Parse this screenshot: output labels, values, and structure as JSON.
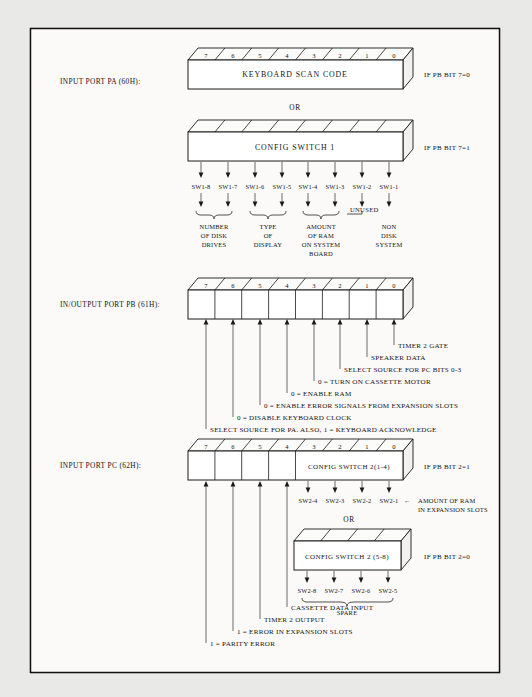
{
  "ports": [
    {
      "id": "pa",
      "label": "INPUT PORT PA (60H):",
      "boxes": [
        {
          "id": "pa-scan",
          "caption": "KEYBOARD SCAN CODE",
          "bits": [
            "7",
            "6",
            "5",
            "4",
            "3",
            "2",
            "1",
            "0"
          ],
          "condition": "IF PB BIT 7=0"
        },
        {
          "id": "pa-config",
          "caption": "CONFIG  SWITCH 1",
          "bits": [
            "",
            "",
            "",
            "",
            "",
            "",
            "",
            ""
          ],
          "condition": "IF PB BIT 7=1"
        }
      ],
      "or_label": "OR",
      "switch_labels": [
        "SW1-8",
        "SW1-7",
        "SW1-6",
        "SW1-5",
        "SW1-4",
        "SW1-3",
        "SW1-2",
        "SW1-1"
      ],
      "groups": [
        {
          "id": "num-disk-drives",
          "lines": [
            "NUMBER",
            "OF DISK",
            "DRIVES"
          ]
        },
        {
          "id": "type-of-display",
          "lines": [
            "TYPE",
            "OF",
            "DISPLAY"
          ]
        },
        {
          "id": "amount-of-ram",
          "lines": [
            "AMOUNT",
            "OF RAM",
            "ON SYSTEM",
            "BOARD"
          ]
        },
        {
          "id": "non-disk-system",
          "lines": [
            "NON",
            "DISK",
            "SYSTEM"
          ]
        }
      ],
      "unused_label": "UNUSED"
    },
    {
      "id": "pb",
      "label": "IN/OUTPUT PORT PB (61H):",
      "boxes": [
        {
          "id": "pb-main",
          "caption": "",
          "bits": [
            "7",
            "6",
            "5",
            "4",
            "3",
            "2",
            "1",
            "0"
          ],
          "condition": ""
        }
      ],
      "callouts": [
        {
          "bit": "0",
          "text": "TIMER 2 GATE"
        },
        {
          "bit": "1",
          "text": "SPEAKER DATA"
        },
        {
          "bit": "2",
          "text": "SELECT SOURCE FOR PC BITS 0-3"
        },
        {
          "bit": "3",
          "text": "0 = TURN ON CASSETTE MOTOR"
        },
        {
          "bit": "4",
          "text": "0 = ENABLE RAM"
        },
        {
          "bit": "5",
          "text": "0 = ENABLE ERROR SIGNALS FROM EXPANSION SLOTS"
        },
        {
          "bit": "6",
          "text": "0 = DISABLE KEYBOARD CLOCK"
        },
        {
          "bit": "7",
          "text": "SELECT SOURCE FOR PA. ALSO, 1 = KEYBOARD ACKNOWLEDGE"
        }
      ]
    },
    {
      "id": "pc",
      "label": "INPUT PORT PC (62H):",
      "boxes": [
        {
          "id": "pc-main",
          "caption": "CONFIG SWITCH 2(1-4)",
          "bits": [
            "7",
            "6",
            "5",
            "4",
            "3",
            "2",
            "1",
            "0"
          ],
          "condition": "IF PB BIT 2=1"
        },
        {
          "id": "pc-alt",
          "caption": "CONFIG SWITCH 2 (5-8)",
          "bits": [
            "",
            "",
            "",
            ""
          ],
          "condition": "IF PB BIT 2=0"
        }
      ],
      "or_label": "OR",
      "switch_labels_upper": [
        "SW2-4",
        "SW2-3",
        "SW2-2",
        "SW2-1"
      ],
      "switch_note_upper": [
        "AMOUNT OF RAM",
        "IN EXPANSION SLOTS"
      ],
      "switch_note_arrow": "←",
      "switch_labels_lower": [
        "SW2-8",
        "SW2-7",
        "SW2-6",
        "SW2-5"
      ],
      "spare_label": "SPARE",
      "callouts": [
        {
          "bit": "4",
          "text": "CASSETTE DATA INPUT"
        },
        {
          "bit": "5",
          "text": "TIMER 2 OUTPUT"
        },
        {
          "bit": "6",
          "text": "1 = ERROR IN EXPANSION SLOTS"
        },
        {
          "bit": "7",
          "text": "1 = PARITY ERROR"
        }
      ]
    }
  ],
  "colors": {
    "paper": "#f3f2f0",
    "ink": "#141414",
    "margin": "#e9e9e7"
  }
}
